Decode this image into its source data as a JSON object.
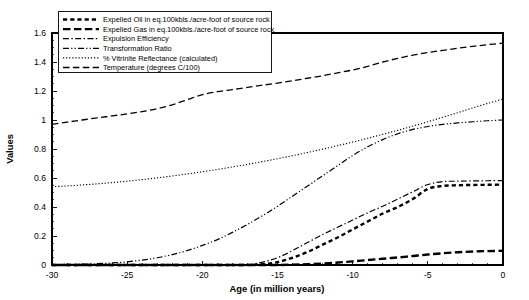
{
  "chart_data": {
    "type": "line",
    "title": "",
    "xlabel": "Age (in million years)",
    "ylabel": "Values",
    "xlim": [
      -30,
      0
    ],
    "ylim": [
      0,
      1.6
    ],
    "xticks": [
      "-30",
      "-25",
      "-20",
      "-15",
      "-10",
      "-5",
      "0"
    ],
    "yticks": [
      "0",
      "0.2",
      "0.4",
      "0.6",
      "0.8",
      "1",
      "1.2",
      "1.4",
      "1.6"
    ],
    "grid": false,
    "legend_position": "top-left",
    "x": [
      -30,
      -29,
      -28,
      -27,
      -26,
      -25,
      -24,
      -23,
      -22,
      -21,
      -20,
      -19,
      -18,
      -17,
      -16,
      -15,
      -14,
      -13,
      -12,
      -11,
      -10,
      -9,
      -8,
      -7,
      -6,
      -5,
      -4,
      -3,
      -2,
      -1,
      0
    ],
    "series": [
      {
        "name": "Expelled Oil in eq.100kbls./acre-foot of source rock",
        "style": "thick-dashed",
        "values": [
          0,
          0,
          0,
          0,
          0,
          0,
          0,
          0,
          0,
          0,
          0,
          0,
          0,
          0,
          0.005,
          0.02,
          0.05,
          0.09,
          0.14,
          0.19,
          0.245,
          0.3,
          0.355,
          0.4,
          0.455,
          0.525,
          0.545,
          0.55,
          0.552,
          0.553,
          0.555
        ]
      },
      {
        "name": "Expelled Gas in eq.100kbls./acre-foot of source rock",
        "style": "thick-long-dashed",
        "values": [
          0,
          0,
          0,
          0,
          0,
          0,
          0,
          0,
          0,
          0,
          0,
          0,
          0,
          0,
          0,
          0,
          0.002,
          0.005,
          0.01,
          0.017,
          0.025,
          0.034,
          0.043,
          0.052,
          0.062,
          0.072,
          0.081,
          0.088,
          0.093,
          0.096,
          0.098
        ]
      },
      {
        "name": "Expulsion Efficiency",
        "style": "dash-dot",
        "values": [
          0,
          0,
          0,
          0,
          0,
          0,
          0,
          0,
          0,
          0,
          0,
          0,
          0,
          0.002,
          0.02,
          0.05,
          0.1,
          0.155,
          0.21,
          0.26,
          0.31,
          0.36,
          0.405,
          0.455,
          0.505,
          0.555,
          0.575,
          0.578,
          0.58,
          0.581,
          0.582
        ]
      },
      {
        "name": "Transformation Ratio",
        "style": "dash-dot-dot",
        "values": [
          0.003,
          0.004,
          0.006,
          0.009,
          0.014,
          0.022,
          0.034,
          0.05,
          0.072,
          0.1,
          0.135,
          0.175,
          0.225,
          0.28,
          0.34,
          0.405,
          0.475,
          0.545,
          0.615,
          0.685,
          0.755,
          0.815,
          0.865,
          0.905,
          0.935,
          0.955,
          0.97,
          0.98,
          0.988,
          0.995,
          1.0
        ]
      },
      {
        "name": "% Vitrinite Reflectance (calculated)",
        "style": "dotted",
        "values": [
          0.54,
          0.545,
          0.552,
          0.56,
          0.568,
          0.578,
          0.589,
          0.601,
          0.614,
          0.628,
          0.643,
          0.659,
          0.676,
          0.694,
          0.713,
          0.733,
          0.754,
          0.776,
          0.799,
          0.823,
          0.848,
          0.874,
          0.901,
          0.929,
          0.958,
          0.988,
          1.019,
          1.051,
          1.084,
          1.115,
          1.145
        ]
      },
      {
        "name": "Temperature (degrees C/100)",
        "style": "long-dashed",
        "values": [
          0.97,
          0.985,
          1.0,
          1.015,
          1.028,
          1.042,
          1.058,
          1.078,
          1.105,
          1.14,
          1.175,
          1.195,
          1.21,
          1.225,
          1.24,
          1.255,
          1.27,
          1.288,
          1.305,
          1.325,
          1.345,
          1.37,
          1.4,
          1.425,
          1.447,
          1.465,
          1.48,
          1.495,
          1.508,
          1.52,
          1.53
        ]
      }
    ]
  },
  "legend": {
    "entries": [
      {
        "label": "Expelled Oil in eq.100kbls./acre-foot of source rock",
        "marker": "thick-dashed-marker"
      },
      {
        "label": "Expelled Gas in eq.100kbls./acre-foot of source rock",
        "marker": "thick-long-dashed-marker"
      },
      {
        "label": "Expulsion Efficiency",
        "marker": "dash-dot-marker"
      },
      {
        "label": "Transformation Ratio",
        "marker": "dash-dot-dot-marker"
      },
      {
        "label": "% Vitrinite Reflectance (calculated)",
        "marker": "dotted-marker"
      },
      {
        "label": "Temperature (degrees C/100)",
        "marker": "long-dashed-marker"
      }
    ]
  },
  "colors": {
    "ink": "#000000",
    "background": "#ffffff"
  }
}
